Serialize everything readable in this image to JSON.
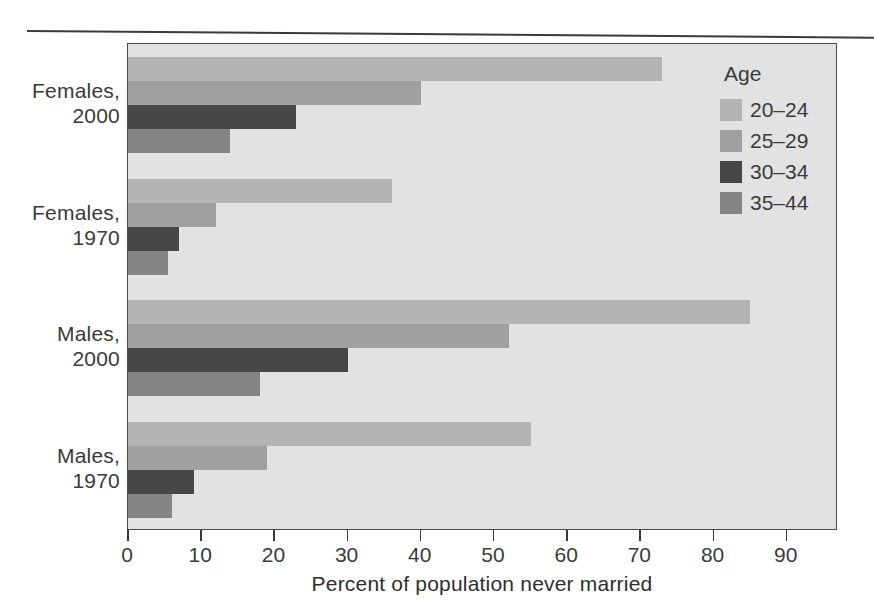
{
  "chart_data": {
    "type": "bar",
    "orientation": "horizontal",
    "title": "",
    "xlabel": "Percent of population never married",
    "ylabel": "",
    "xlim": [
      0,
      97
    ],
    "xticks": [
      0,
      10,
      20,
      30,
      40,
      50,
      60,
      70,
      80,
      90
    ],
    "xtick_labels": [
      "0",
      "10",
      "20",
      "30",
      "40",
      "50",
      "60",
      "70",
      "80",
      "90"
    ],
    "grid": false,
    "legend_title": "Age",
    "legend_position": "top-right-inside",
    "categories": [
      "Females, 2000",
      "Females, 1970",
      "Males, 2000",
      "Males, 1970"
    ],
    "category_lines": [
      [
        "Females,",
        "2000"
      ],
      [
        "Females,",
        "1970"
      ],
      [
        "Males,",
        "2000"
      ],
      [
        "Males,",
        "1970"
      ]
    ],
    "series": [
      {
        "name": "20–24",
        "color": "#b4b4b4",
        "values": [
          73,
          36,
          85,
          55
        ]
      },
      {
        "name": "25–29",
        "color": "#a0a0a0",
        "values": [
          40,
          12,
          52,
          19
        ]
      },
      {
        "name": "30–34",
        "color": "#474747",
        "values": [
          23,
          7,
          30,
          9
        ]
      },
      {
        "name": "35–44",
        "color": "#848484",
        "values": [
          14,
          5.5,
          18,
          6
        ]
      }
    ]
  },
  "legend": {
    "title": "Age",
    "entries": [
      {
        "label": "20–24",
        "color": "#b4b4b4"
      },
      {
        "label": "25–29",
        "color": "#a0a0a0"
      },
      {
        "label": "30–34",
        "color": "#474747"
      },
      {
        "label": "35–44",
        "color": "#848484"
      }
    ]
  },
  "axis": {
    "x_title": "Percent of population never married",
    "tick_labels": [
      "0",
      "10",
      "20",
      "30",
      "40",
      "50",
      "60",
      "70",
      "80",
      "90"
    ]
  },
  "category_labels": [
    {
      "line1": "Females,",
      "line2": "2000"
    },
    {
      "line1": "Females,",
      "line2": "1970"
    },
    {
      "line1": "Males,",
      "line2": "2000"
    },
    {
      "line1": "Males,",
      "line2": "1970"
    }
  ],
  "colors": {
    "panel_background": "#e2e2e2",
    "frame": "#4a4a4a",
    "text": "#3a3a3a",
    "page_background": "#ffffff"
  }
}
